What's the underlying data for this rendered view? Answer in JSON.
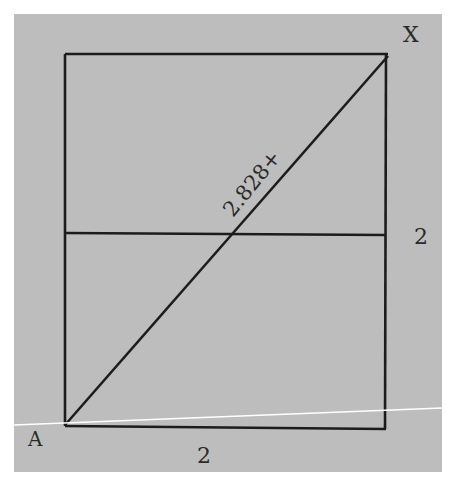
{
  "diagram": {
    "type": "geometry",
    "colors": {
      "background": "#ffffff",
      "panel": "#bdbdbd",
      "stroke": "#1c1c1c",
      "highlight_line": "#ffffff",
      "text": "#2a2a2a"
    },
    "points": {
      "A": {
        "label": "A"
      },
      "X": {
        "label": "X"
      }
    },
    "labels": {
      "diagonal": "2.828+",
      "right_side": "2",
      "bottom_side": "2"
    }
  }
}
